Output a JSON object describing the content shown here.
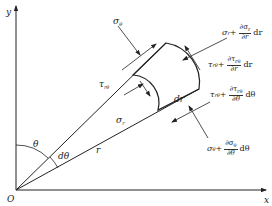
{
  "diagram": {
    "type": "polar-stress-element",
    "axes": {
      "x_label": "x",
      "y_label": "y",
      "origin_label": "O"
    },
    "angles": {
      "theta_label": "θ",
      "dtheta_label": "dθ"
    },
    "radius_label": "r",
    "element_label": "dr",
    "stresses": {
      "sigma_theta": "σ",
      "sigma_theta_sub": "θ",
      "tau_rtheta": "τ",
      "tau_rtheta_sub": "rθ",
      "sigma_r": "σ",
      "sigma_r_sub": "r"
    },
    "expressions": {
      "sigma_r_plus": {
        "base": "σ",
        "sub": "r",
        "plus": "+",
        "num": "∂σ",
        "num_sub": "r",
        "den": "∂r",
        "tail": "dr"
      },
      "tau_r_plus": {
        "base": "τ",
        "sub": "rθ",
        "plus": "+",
        "num": "∂τ",
        "num_sub": "rθ",
        "den": "∂r",
        "tail": "dr"
      },
      "tau_theta_plus": {
        "base": "τ",
        "sub": "rθ",
        "plus": "+",
        "num": "∂τ",
        "num_sub": "rθ",
        "den": "∂θ",
        "tail": "dθ"
      },
      "sigma_theta_plus": {
        "base": "σ",
        "sub": "θ",
        "plus": "+",
        "num": "∂σ",
        "num_sub": "θ",
        "den": "∂θ",
        "tail": "dθ"
      }
    },
    "colors": {
      "line": "#222222",
      "background": "#ffffff"
    }
  }
}
